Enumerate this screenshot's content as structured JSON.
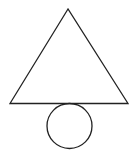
{
  "diagram": {
    "background": "#ffffff",
    "stroke_color": "#222222",
    "shapes": [
      {
        "type": "triangle",
        "points": [
          [
            68,
            9
          ],
          [
            10,
            103.5
          ],
          [
            128,
            103.5
          ]
        ]
      },
      {
        "type": "circle",
        "cx": 69.5,
        "cy": 126,
        "r": 22.5
      }
    ]
  }
}
